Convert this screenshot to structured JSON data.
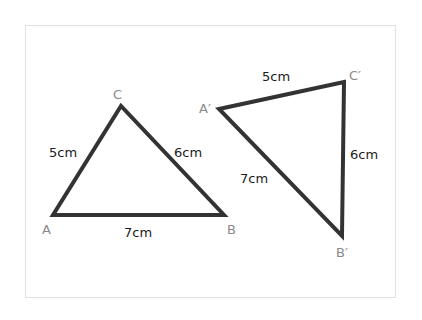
{
  "diagram": {
    "triangle_1": {
      "vertices": {
        "A": {
          "label": "A",
          "x": 53,
          "y": 215
        },
        "B": {
          "label": "B",
          "x": 224,
          "y": 215
        },
        "C": {
          "label": "C",
          "x": 121,
          "y": 106
        }
      },
      "sides": {
        "AC": "5cm",
        "CB": "6cm",
        "AB": "7cm"
      }
    },
    "triangle_2": {
      "vertices": {
        "A": {
          "label": "A′",
          "x": 219,
          "y": 109
        },
        "B": {
          "label": "B′",
          "x": 342,
          "y": 236
        },
        "C": {
          "label": "C′",
          "x": 344,
          "y": 82
        }
      },
      "sides": {
        "AC": "5cm",
        "CB": "6cm",
        "AB": "7cm"
      }
    },
    "colors": {
      "stroke": "#333333",
      "vertex_label": "#8a8a8a",
      "side_label": "#1a1a1a",
      "frame_border": "#e2e2e2"
    }
  }
}
